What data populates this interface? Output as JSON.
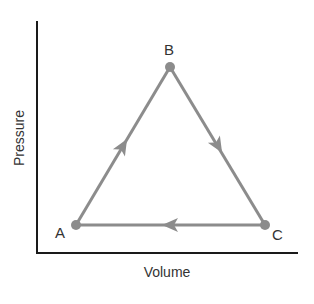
{
  "diagram": {
    "type": "pv-cycle",
    "axes": {
      "xlabel": "Volume",
      "ylabel": "Pressure"
    },
    "points": [
      {
        "id": "A",
        "label": "A"
      },
      {
        "id": "B",
        "label": "B"
      },
      {
        "id": "C",
        "label": "C"
      }
    ],
    "path": [
      "A",
      "B",
      "C",
      "A"
    ],
    "colors": {
      "axis": "#1a1a1a",
      "cycle": "#8c8c8c",
      "text": "#333333"
    }
  }
}
